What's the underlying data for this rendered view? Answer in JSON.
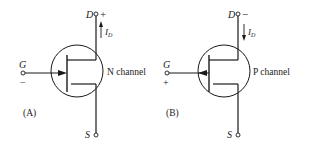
{
  "diagram": {
    "type": "JFET symbols",
    "ink_color": "#1a1a1a",
    "background": "#ffffff",
    "panels": [
      {
        "id": "A",
        "caption": "(A)",
        "channel_label": "N channel",
        "terminals": {
          "drain": {
            "label": "D",
            "polarity": "+"
          },
          "gate": {
            "label": "G",
            "polarity": "−"
          },
          "source": {
            "label": "S"
          }
        },
        "current": {
          "label": "I",
          "subscript": "D",
          "direction": "up"
        },
        "gate_arrow": "into-channel"
      },
      {
        "id": "B",
        "caption": "(B)",
        "channel_label": "P channel",
        "terminals": {
          "drain": {
            "label": "D",
            "polarity": "−"
          },
          "gate": {
            "label": "G",
            "polarity": "+"
          },
          "source": {
            "label": "S"
          }
        },
        "current": {
          "label": "I",
          "subscript": "D",
          "direction": "down"
        },
        "gate_arrow": "out-of-channel"
      }
    ]
  }
}
